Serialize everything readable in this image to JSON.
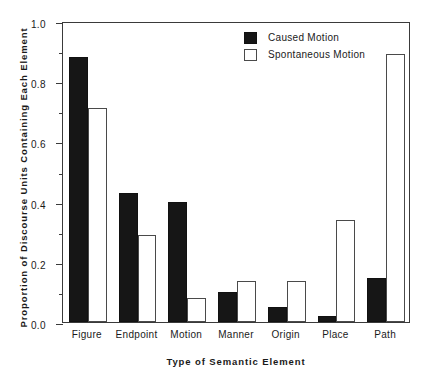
{
  "chart_data": {
    "type": "bar",
    "title": "",
    "xlabel": "Type of Semantic Element",
    "ylabel": "Proportion of Discourse Units Containing Each Element",
    "categories": [
      "Figure",
      "Endpoint",
      "Motion",
      "Manner",
      "Origin",
      "Place",
      "Path"
    ],
    "series": [
      {
        "name": "Caused Motion",
        "color": "#161616",
        "values": [
          0.88,
          0.43,
          0.4,
          0.1,
          0.05,
          0.02,
          0.145
        ]
      },
      {
        "name": "Spontaneous Motion",
        "color": "#ffffff",
        "values": [
          0.71,
          0.29,
          0.08,
          0.135,
          0.135,
          0.34,
          0.89
        ]
      }
    ],
    "ylim": [
      0.0,
      1.0
    ],
    "ytick_labels": [
      "0.0",
      "0.2",
      "0.4",
      "0.6",
      "0.8",
      "1.0"
    ],
    "ytick_values": [
      0.0,
      0.2,
      0.4,
      0.6,
      0.8,
      1.0
    ],
    "yminor_values": [
      0.1,
      0.3,
      0.5,
      0.7,
      0.9
    ],
    "grid": false,
    "legend_position": "top-right"
  },
  "legend": {
    "items": [
      {
        "label": "Caused Motion",
        "swatch": "filled-black-square"
      },
      {
        "label": "Spontaneous Motion",
        "swatch": "open-white-square"
      }
    ]
  },
  "top_fragment": ""
}
